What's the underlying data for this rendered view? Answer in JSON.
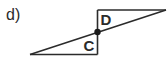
{
  "problem": {
    "part_label": "d)"
  },
  "figure": {
    "stroke_color": "#2b2b2b",
    "triangles": [
      {
        "name": "upper",
        "label": "D",
        "vertices": [
          [
            97.5,
            10
          ],
          [
            166,
            10
          ],
          [
            97.5,
            32
          ]
        ]
      },
      {
        "name": "lower",
        "label": "C",
        "vertices": [
          [
            30,
            54.5
          ],
          [
            97.5,
            54.5
          ],
          [
            97.5,
            32
          ]
        ]
      }
    ],
    "center_point": {
      "x": 97.5,
      "y": 32,
      "radius": 3.2
    },
    "labels": {
      "upper_angle": "D",
      "lower_angle": "C"
    }
  }
}
